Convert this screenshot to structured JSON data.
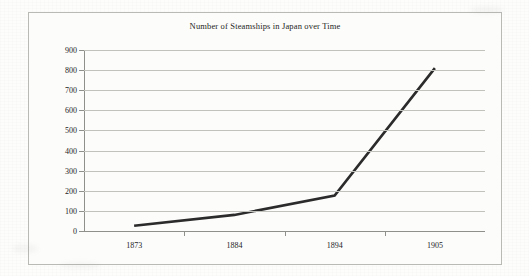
{
  "chart_data": {
    "type": "line",
    "title": "Number of Steamships in Japan over Time",
    "xlabel": "",
    "ylabel": "",
    "categories": [
      "1873",
      "1884",
      "1894",
      "1905"
    ],
    "x": [
      1873,
      1884,
      1894,
      1905
    ],
    "values": [
      26,
      80,
      176,
      810
    ],
    "series": [
      {
        "name": "Number of Steamships",
        "values": [
          26,
          80,
          176,
          810
        ]
      }
    ],
    "ylim": [
      0,
      900
    ],
    "y_ticks": [
      0,
      100,
      200,
      300,
      400,
      500,
      600,
      700,
      800,
      900
    ],
    "y_tick_labels": [
      "0",
      "100",
      "200",
      "300",
      "400",
      "500",
      "600",
      "700",
      "800",
      "900"
    ],
    "x_tick_labels": [
      "1873",
      "1884",
      "1894",
      "1905"
    ],
    "grid": "horizontal",
    "legend": "none",
    "line_color": "#2b2b2b",
    "grid_color": "#c2c2bd",
    "axis_color": "#8f8f8b",
    "frame_color": "#b9b9b6",
    "background_color": "#fcfcfb"
  }
}
